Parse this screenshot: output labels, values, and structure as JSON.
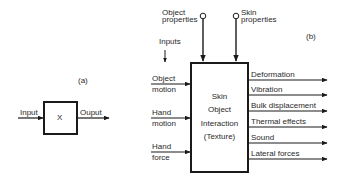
{
  "panel_a": {
    "label": "(a)",
    "input_label": "Input",
    "output_label": "Ouput",
    "box_label": "X"
  },
  "panel_b": {
    "label": "(b)",
    "top_inputs": [
      {
        "line1": "Object",
        "line2": "properties"
      },
      {
        "line1": "Skin",
        "line2": "properties"
      }
    ],
    "inputs_label": "Inputs",
    "left_inputs": [
      {
        "line1": "Object",
        "line2": "motion"
      },
      {
        "line1": "Hand",
        "line2": "motion"
      },
      {
        "line1": "Hand",
        "line2": "force"
      }
    ],
    "box_lines": [
      "Skin",
      "Object",
      "Interaction",
      "(Texture)"
    ],
    "outputs": [
      "Deformation",
      "Vibration",
      "Bulk displacement",
      "Thermal effects",
      "Sound",
      "Lateral forces"
    ]
  },
  "colors": {
    "stroke": "#1a1a1a",
    "text": "#2a2a2a",
    "background": "#ffffff"
  }
}
